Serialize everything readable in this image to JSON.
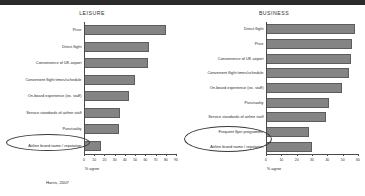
{
  "source_note": "Harris, 2007",
  "charts": [
    {
      "key": "leisure",
      "title": "LEISURE",
      "xlabel": "% agree"
    },
    {
      "key": "business",
      "title": "BUSINESS",
      "xlabel": "% agree"
    }
  ],
  "annotations": {
    "leisure_highlight": "Airline brand name / reputation",
    "business_highlight": "Frequent flyer programme & Airline brand name / reputation"
  },
  "chart_data": [
    {
      "type": "bar",
      "orientation": "horizontal",
      "title": "LEISURE",
      "xlabel": "% agree",
      "ylabel": "",
      "xlim": [
        0,
        90
      ],
      "xticks": [
        0,
        10,
        20,
        30,
        40,
        50,
        60,
        70,
        80,
        90
      ],
      "grid": false,
      "legend": false,
      "categories": [
        "Price",
        "Direct flight",
        "Convenience of UK airport",
        "Convenient flight times/schedule",
        "On-board experience (ex. staff)",
        "Service standards of airline staff",
        "Punctuality",
        "Airline brand name / reputation"
      ],
      "values": [
        78,
        62,
        61,
        48,
        42,
        33,
        32,
        15
      ]
    },
    {
      "type": "bar",
      "orientation": "horizontal",
      "title": "BUSINESS",
      "xlabel": "% agree",
      "ylabel": "",
      "xlim": [
        0,
        60
      ],
      "xticks": [
        0,
        10,
        20,
        30,
        40,
        50,
        60
      ],
      "grid": false,
      "legend": false,
      "categories": [
        "Direct flight",
        "Price",
        "Convenience of UK airport",
        "Convenient flight times/schedule",
        "On-board experience (ex. staff)",
        "Punctuality",
        "Service standards of airline staff",
        "Frequent flyer programme",
        "Airline brand name / reputation"
      ],
      "values": [
        57,
        55,
        54,
        53,
        48,
        40,
        38,
        27,
        29
      ]
    }
  ]
}
